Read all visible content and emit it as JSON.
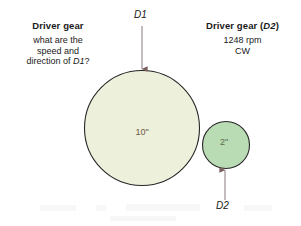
{
  "figure": {
    "left_block": {
      "heading": "Driver gear",
      "line1": "what are the",
      "line2": "speed and",
      "line3": "direction of D1?"
    },
    "right_block": {
      "heading": "Driver gear (D2)",
      "line1": "1248 rpm",
      "line2": "CW"
    },
    "labels": {
      "d1": "D1",
      "d2": "D2",
      "big_gear_diameter": "10\"",
      "small_gear_diameter": "2\""
    },
    "copyright": "© 2014 Cengage Learning",
    "colors": {
      "big_gear_fill": "#edf1dc",
      "small_gear_fill": "#b9dcb4",
      "gear_stroke": "#262626",
      "arrow": "#9d8f93",
      "arrow_head": "#7c5e5e",
      "background": "#ffffff"
    }
  },
  "chart_data": {
    "type": "diagram",
    "elements": [
      {
        "name": "big-gear",
        "label": "D1",
        "diameter_in": 10,
        "cx": 142,
        "cy": 128,
        "r": 58,
        "fill": "#edf1dc",
        "rpm": null,
        "direction": null
      },
      {
        "name": "small-gear",
        "label": "D2",
        "diameter_in": 2,
        "cx": 226,
        "cy": 145,
        "r": 24,
        "fill": "#b9dcb4",
        "rpm": 1248,
        "direction": "CW"
      }
    ]
  }
}
